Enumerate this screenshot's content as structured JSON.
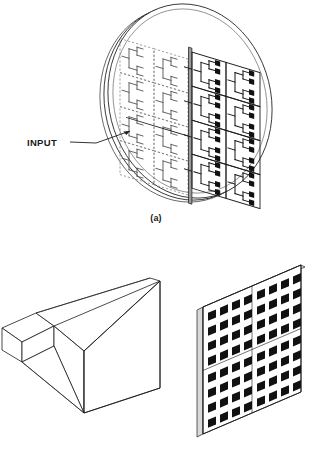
{
  "figure": {
    "panel_a": {
      "caption": "(a)",
      "input_label": "INPUT",
      "description": "circular-substrate microstrip patch array with corporate feed network",
      "subarray_grid": {
        "columns": 4,
        "rows": 4
      },
      "visible_columns": 2,
      "hidden_columns": 2,
      "patches_per_subarray": 4
    },
    "panel_b": {
      "caption": "(b)",
      "horn": {
        "description": "pyramidal horn antenna with rectangular waveguide feed"
      },
      "array_panel": {
        "description": "equivalent-aperture microstrip patch array panel",
        "quadrants": 4,
        "patches_per_quadrant_rows": 4,
        "patches_per_quadrant_cols": 4,
        "total_patches": 64
      }
    }
  },
  "colors": {
    "ink": "#1d1d1d",
    "patch_fill": "#111111",
    "panel_face": "#ffffff",
    "edge_shade": "#d9d9d9",
    "hidden_line": "#6e6e6e",
    "background": "#ffffff"
  }
}
